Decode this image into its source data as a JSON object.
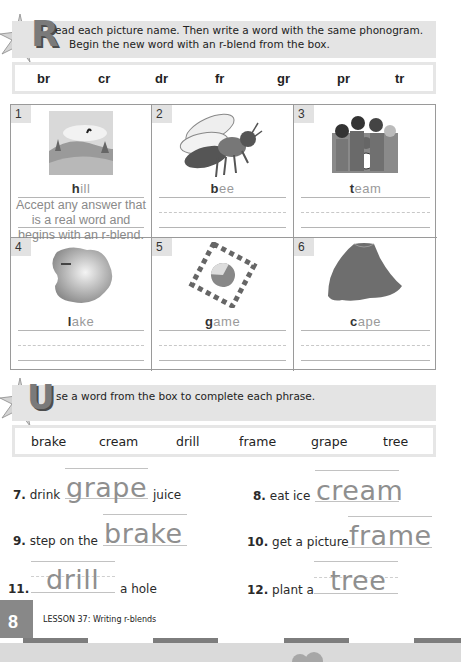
{
  "section_r": {
    "drop_letter": "R",
    "instruction_line1": "ead each picture name. Then write a word with the same phonogram.",
    "instruction_line2": "Begin the new word with an r-blend from the box.",
    "blends": [
      "br",
      "cr",
      "dr",
      "fr",
      "gr",
      "pr",
      "tr"
    ],
    "items": [
      {
        "number": "1",
        "picture": "hill-icon",
        "word_first": "h",
        "word_rest": "ill",
        "answer_note": [
          "Accept any answer that",
          "is a real word and",
          "begins with an r-blend."
        ]
      },
      {
        "number": "2",
        "picture": "bee-icon",
        "word_first": "b",
        "word_rest": "ee"
      },
      {
        "number": "3",
        "picture": "team-icon",
        "word_first": "t",
        "word_rest": "eam"
      },
      {
        "number": "4",
        "picture": "lake-icon",
        "word_first": "l",
        "word_rest": "ake"
      },
      {
        "number": "5",
        "picture": "game-icon",
        "word_first": "g",
        "word_rest": "ame"
      },
      {
        "number": "6",
        "picture": "cape-icon",
        "word_first": "c",
        "word_rest": "ape"
      }
    ]
  },
  "section_u": {
    "drop_letter": "U",
    "instruction": "se a word from the box to complete each phrase.",
    "words": [
      "brake",
      "cream",
      "drill",
      "frame",
      "grape",
      "tree"
    ],
    "phrases": [
      {
        "number": "7.",
        "before": "drink",
        "answer": "grape",
        "after": "juice"
      },
      {
        "number": "8.",
        "before": "eat ice",
        "answer": "cream",
        "after": ""
      },
      {
        "number": "9.",
        "before": "step on the",
        "answer": "brake",
        "after": ""
      },
      {
        "number": "10.",
        "before": "get a picture",
        "answer": "frame",
        "after": ""
      },
      {
        "number": "11.",
        "before": "",
        "answer": "drill",
        "after": "a hole"
      },
      {
        "number": "12.",
        "before": "plant a",
        "answer": "tree",
        "after": ""
      }
    ]
  },
  "footer": {
    "page_number": "78",
    "page_number_visible": "8",
    "lesson_title": "LESSON 37: Writing r-blends"
  },
  "colors": {
    "banner_bg": "#e4e4e4",
    "drop_letter": "#7a7a7a",
    "handwriting": "#8f8f8f",
    "footer_box": "#888888",
    "stripe_dark": "#7d7d7d"
  }
}
